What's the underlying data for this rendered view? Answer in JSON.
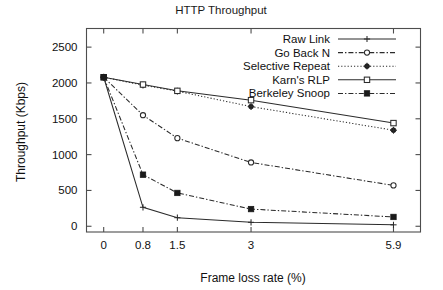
{
  "chart_data": {
    "type": "line",
    "title": "HTTP Throughput",
    "xlabel": "Frame loss rate (%)",
    "ylabel": "Throughput (Kbps)",
    "x": [
      0,
      0.8,
      1.5,
      3,
      5.9
    ],
    "xtick_labels": [
      "0",
      "0.8",
      "1.5",
      "3",
      "5.9"
    ],
    "ytick_labels": [
      "0",
      "500",
      "1000",
      "1500",
      "2000",
      "2500"
    ],
    "ytick_values": [
      0,
      500,
      1000,
      1500,
      2000,
      2500
    ],
    "xlim": [
      -0.35,
      6.45
    ],
    "ylim": [
      -80,
      2760
    ],
    "grid": false,
    "legend_position": "top-right",
    "series": [
      {
        "name": "Raw Link",
        "values": [
          2080,
          265,
          120,
          55,
          20
        ],
        "line_style": "solid",
        "marker": "plus"
      },
      {
        "name": "Go Back N",
        "values": [
          2080,
          1550,
          1230,
          890,
          570
        ],
        "line_style": "dash-dot",
        "marker": "open-circle"
      },
      {
        "name": "Selective Repeat",
        "values": [
          2080,
          1970,
          1885,
          1670,
          1340
        ],
        "line_style": "dotted",
        "marker": "filled-circle"
      },
      {
        "name": "Karn's RLP",
        "values": [
          2080,
          1978,
          1890,
          1760,
          1440
        ],
        "line_style": "solid",
        "marker": "open-square"
      },
      {
        "name": "Berkeley Snoop",
        "values": [
          2080,
          720,
          465,
          240,
          130
        ],
        "line_style": "dash-dot",
        "marker": "filled-square"
      }
    ],
    "colors": {
      "background": "#ffffff",
      "ink": "#1a1a1a",
      "frame": "#4d4d4d"
    }
  }
}
